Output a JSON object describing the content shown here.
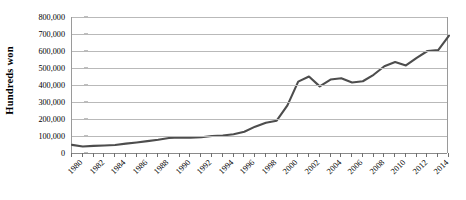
{
  "chart_data": {
    "type": "line",
    "title": "",
    "xlabel": "",
    "ylabel": "Hundreds won",
    "xlim": [
      1980,
      2015
    ],
    "ylim": [
      0,
      800000
    ],
    "grid": true,
    "legend": "none",
    "series_color": "#4d4d4d",
    "gridline_color": "#b9b9b9",
    "axis_color": "#8a8a8a",
    "y_ticks": [
      {
        "value": 0,
        "label": "0"
      },
      {
        "value": 100000,
        "label": "100,000"
      },
      {
        "value": 200000,
        "label": "200,000"
      },
      {
        "value": 300000,
        "label": "300,000"
      },
      {
        "value": 400000,
        "label": "400,000"
      },
      {
        "value": 500000,
        "label": "500,000"
      },
      {
        "value": 600000,
        "label": "600,000"
      },
      {
        "value": 700000,
        "label": "700,000"
      },
      {
        "value": 800000,
        "label": "800,000"
      }
    ],
    "x_tick_labels": [
      "1980",
      "1982",
      "1984",
      "1986",
      "1988",
      "1990",
      "1992",
      "1994",
      "1996",
      "1998",
      "2000",
      "2002",
      "2004",
      "2006",
      "2008",
      "2010",
      "2012",
      "2014"
    ],
    "x": [
      1980,
      1981,
      1982,
      1983,
      1984,
      1985,
      1986,
      1987,
      1988,
      1989,
      1990,
      1991,
      1992,
      1993,
      1994,
      1995,
      1996,
      1997,
      1998,
      1999,
      2000,
      2001,
      2002,
      2003,
      2004,
      2005,
      2006,
      2007,
      2008,
      2009,
      2010,
      2011,
      2012,
      2013,
      2014,
      2015
    ],
    "values": [
      48000,
      38000,
      42000,
      44000,
      47000,
      55000,
      62000,
      70000,
      78000,
      88000,
      92000,
      90000,
      93000,
      100000,
      103000,
      110000,
      125000,
      155000,
      178000,
      190000,
      280000,
      420000,
      450000,
      392000,
      432000,
      440000,
      415000,
      422000,
      460000,
      510000,
      535000,
      515000,
      560000,
      600000,
      605000,
      690000
    ]
  }
}
